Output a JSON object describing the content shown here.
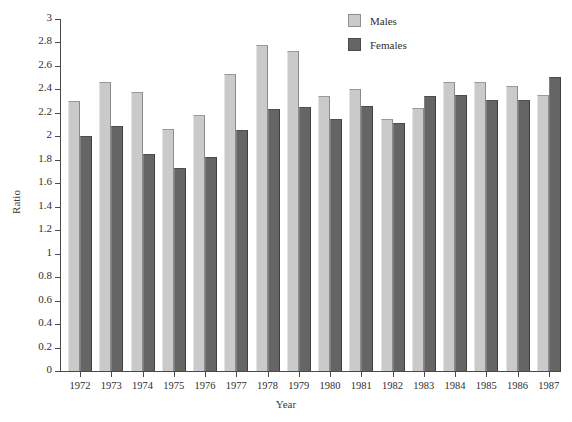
{
  "chart_data": {
    "type": "bar",
    "title": "",
    "xlabel": "Year",
    "ylabel": "Ratio",
    "categories": [
      "1972",
      "1973",
      "1974",
      "1975",
      "1976",
      "1977",
      "1978",
      "1979",
      "1980",
      "1981",
      "1982",
      "1983",
      "1984",
      "1985",
      "1986",
      "1987"
    ],
    "series": [
      {
        "name": "Males",
        "color": "#cacaca",
        "values": [
          2.3,
          2.46,
          2.38,
          2.06,
          2.18,
          2.53,
          2.78,
          2.73,
          2.34,
          2.4,
          2.15,
          2.24,
          2.46,
          2.46,
          2.43,
          2.35
        ]
      },
      {
        "name": "Females",
        "color": "#656565",
        "values": [
          2.0,
          2.09,
          1.85,
          1.73,
          1.82,
          2.05,
          2.23,
          2.25,
          2.15,
          2.26,
          2.11,
          2.34,
          2.35,
          2.31,
          2.31,
          2.51
        ]
      }
    ],
    "ylim": [
      0,
      3
    ],
    "ytick_values": [
      0,
      0.2,
      0.4,
      0.6,
      0.8,
      1,
      1.2,
      1.4,
      1.6,
      1.8,
      2,
      2.2,
      2.4,
      2.6,
      2.8,
      3
    ],
    "ytick_labels": [
      "0",
      "0.2",
      "0.4",
      "0.6",
      "0.8",
      "1",
      "1.2",
      "1.4",
      "1.6",
      "1.8",
      "2",
      "2.2",
      "2.4",
      "2.6",
      "2.8",
      "3"
    ],
    "grid": false,
    "legend_position": "top-right"
  }
}
